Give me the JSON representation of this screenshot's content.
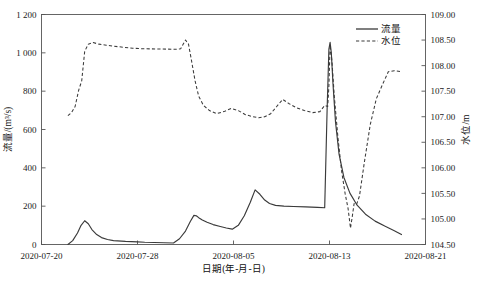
{
  "chart_data": {
    "type": "line",
    "title": "",
    "xlabel": "日期(年-月-日)",
    "ylabel": "流量/(m³/s)",
    "ylabel_right": "水位/m",
    "grid": false,
    "legend_position": "top-right",
    "x_tick_labels": [
      "2020-07-20",
      "2020-07-28",
      "2020-08-05",
      "2020-08-13",
      "2020-08-21"
    ],
    "x_tick_values": [
      0,
      8,
      16,
      24,
      32
    ],
    "xlim": [
      0,
      32
    ],
    "y_tick_labels": [
      "0",
      "200",
      "400",
      "600",
      "800",
      "1 000",
      "1 200"
    ],
    "y_tick_values": [
      0,
      200,
      400,
      600,
      800,
      1000,
      1200
    ],
    "ylim": [
      0,
      1200
    ],
    "y2_tick_labels": [
      "104.50",
      "105.00",
      "105.50",
      "106.00",
      "106.50",
      "107.00",
      "107.50",
      "108.00",
      "108.50",
      "109.00"
    ],
    "y2_tick_values": [
      104.5,
      105.0,
      105.5,
      106.0,
      106.5,
      107.0,
      107.5,
      108.0,
      108.5,
      109.0
    ],
    "y2lim": [
      104.5,
      109.0
    ],
    "series": [
      {
        "name": "流量",
        "axis": "left",
        "style": "solid",
        "color": "#3a3a3a",
        "x": [
          2.2,
          2.6,
          3.0,
          3.3,
          3.6,
          3.9,
          4.2,
          4.6,
          5.0,
          5.5,
          6.0,
          7.0,
          8.0,
          8.6,
          11.0,
          11.5,
          12.0,
          12.4,
          12.7,
          12.9,
          13.1,
          13.4,
          13.8,
          14.3,
          14.9,
          15.4,
          15.9,
          16.4,
          16.9,
          17.4,
          17.8,
          18.2,
          18.6,
          19.0,
          19.5,
          20.2,
          21.0,
          22.0,
          23.0,
          23.6,
          23.8,
          23.95,
          24.05,
          24.15,
          24.3,
          24.5,
          24.8,
          25.2,
          25.7,
          26.3,
          27.0,
          27.8,
          28.6,
          29.4,
          30.0
        ],
        "values": [
          0,
          20,
          60,
          100,
          124,
          108,
          78,
          52,
          36,
          26,
          20,
          16,
          14,
          12,
          8,
          30,
          70,
          120,
          152,
          150,
          140,
          128,
          116,
          104,
          94,
          86,
          80,
          100,
          150,
          220,
          285,
          262,
          232,
          214,
          204,
          200,
          198,
          196,
          194,
          192,
          700,
          1020,
          1055,
          1000,
          830,
          640,
          470,
          350,
          268,
          205,
          158,
          122,
          96,
          72,
          52
        ]
      },
      {
        "name": "水位",
        "axis": "right",
        "style": "dashed",
        "color": "#3a3a3a",
        "x": [
          2.2,
          2.5,
          2.8,
          3.1,
          3.35,
          3.6,
          3.9,
          4.3,
          4.8,
          5.4,
          6.0,
          6.8,
          7.6,
          8.4,
          11.2,
          11.6,
          12.0,
          12.25,
          12.5,
          12.8,
          13.1,
          13.5,
          14.0,
          14.6,
          15.2,
          15.8,
          16.4,
          17.0,
          17.6,
          18.1,
          18.6,
          19.1,
          19.6,
          20.1,
          20.6,
          21.2,
          21.9,
          22.6,
          23.2,
          23.6,
          23.85,
          23.95,
          24.05,
          24.2,
          24.4,
          24.7,
          25.0,
          25.3,
          25.55,
          25.75,
          25.9,
          26.05,
          26.25,
          26.5,
          26.9,
          27.4,
          27.9,
          28.4,
          28.9,
          29.4,
          30.0
        ],
        "values": [
          107.02,
          107.08,
          107.2,
          107.52,
          107.7,
          108.28,
          108.42,
          108.45,
          108.42,
          108.4,
          108.38,
          108.36,
          108.34,
          108.33,
          108.32,
          108.33,
          108.5,
          108.42,
          108.1,
          107.7,
          107.4,
          107.22,
          107.12,
          107.06,
          107.1,
          107.16,
          107.12,
          107.04,
          107.0,
          106.98,
          107.0,
          107.06,
          107.2,
          107.34,
          107.26,
          107.18,
          107.12,
          107.08,
          107.1,
          107.22,
          107.2,
          107.6,
          108.4,
          108.1,
          107.4,
          106.6,
          105.95,
          105.5,
          105.2,
          104.82,
          105.05,
          105.3,
          105.28,
          105.45,
          106.1,
          106.85,
          107.35,
          107.62,
          107.88,
          107.9,
          107.88
        ]
      }
    ],
    "legend": [
      {
        "label": "流量",
        "style": "solid"
      },
      {
        "label": "水位",
        "style": "dashed"
      }
    ]
  }
}
